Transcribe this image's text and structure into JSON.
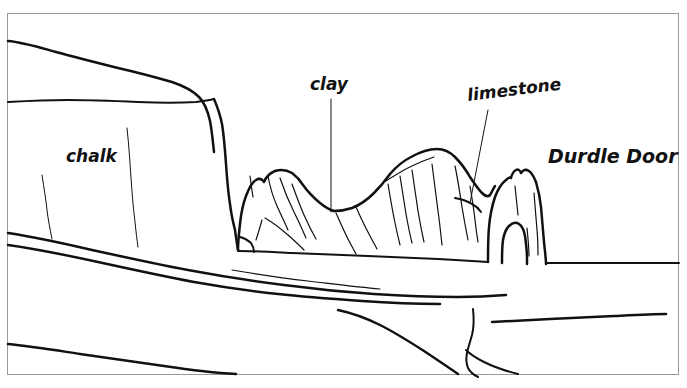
{
  "figure": {
    "kind": "hand-drawn line diagram",
    "background_color": "#ffffff",
    "ink_color": "#111111",
    "frame_color": "#9a9a9a",
    "scan_artifact_text": "· ·· · · ··· ·· ······ ······"
  },
  "labels": {
    "chalk": {
      "text": "chalk",
      "x": 66,
      "y": 162
    },
    "clay": {
      "text": "clay",
      "x": 310,
      "y": 90
    },
    "limestone": {
      "text": "limestone",
      "x": 468,
      "y": 101,
      "rotation": -7
    },
    "durdle_door": {
      "text": "Durdle Door",
      "x": 548,
      "y": 163
    }
  },
  "leaders": [
    {
      "name": "clay-leader-line",
      "from_x": 331,
      "from_y": 99,
      "to_x": 331,
      "to_y": 212
    },
    {
      "name": "limestone-leader-line",
      "from_x": 488,
      "from_y": 110,
      "to_x": 470,
      "to_y": 203
    }
  ],
  "frame": {
    "x": 7,
    "y": 13,
    "width": 672,
    "height": 362
  }
}
